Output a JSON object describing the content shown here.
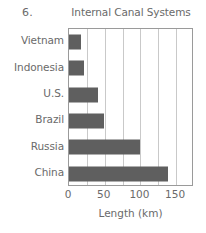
{
  "problem_number": "6.",
  "chart_data": {
    "type": "bar",
    "orientation": "horizontal",
    "title": "Internal Canal Systems",
    "xlabel": "Length (km)",
    "ylabel": "",
    "categories": [
      "Vietnam",
      "Indonesia",
      "U.S.",
      "Brazil",
      "Russia",
      "China"
    ],
    "values": [
      17,
      21,
      40,
      49,
      100,
      139
    ],
    "xlim": [
      0,
      175
    ],
    "xticks": [
      0,
      50,
      100,
      150
    ],
    "xtick_labels": [
      "0",
      "50",
      "100",
      "150"
    ],
    "gridlines_at": [
      0,
      25,
      50,
      75,
      100,
      125,
      150,
      175
    ],
    "grid": true,
    "legend": false,
    "bar_color": "#5f5f5f",
    "grid_color": "#c9c9c9",
    "frame_color": "#9a9a9a",
    "text_color": "#6a6a6a"
  }
}
